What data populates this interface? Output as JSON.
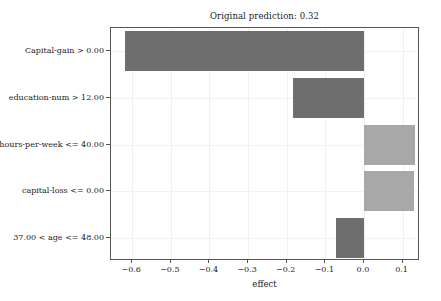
{
  "chart_data": {
    "type": "bar",
    "orientation": "horizontal",
    "title": "Original prediction: 0.32",
    "xlabel": "effect",
    "ylabel": "",
    "categories": [
      "Capital-gain > 0.00",
      "education-num > 12.00",
      "hours-per-week <= 40.00",
      "capital-loss <= 0.00",
      "37.00 < age <= 48.00"
    ],
    "values": [
      -0.618,
      -0.183,
      0.131,
      0.13,
      -0.073
    ],
    "bar_colors": [
      "#6e6e6e",
      "#6e6e6e",
      "#a8a8a8",
      "#a8a8a8",
      "#6e6e6e"
    ],
    "xlim": [
      -0.655,
      0.145
    ],
    "xticks": [
      -0.6,
      -0.5,
      -0.4,
      -0.3,
      -0.2,
      -0.1,
      0.0,
      0.1
    ],
    "xtick_labels": [
      "−0.6",
      "−0.5",
      "−0.4",
      "−0.3",
      "−0.2",
      "−0.1",
      "0.0",
      "0.1"
    ],
    "grid": true,
    "legend": null,
    "colors": {
      "negative_bar": "#6e6e6e",
      "positive_bar": "#a8a8a8",
      "axis": "#555555",
      "grid": "#f0f0f0",
      "background": "#ffffff",
      "text": "#1a1a1a"
    }
  }
}
